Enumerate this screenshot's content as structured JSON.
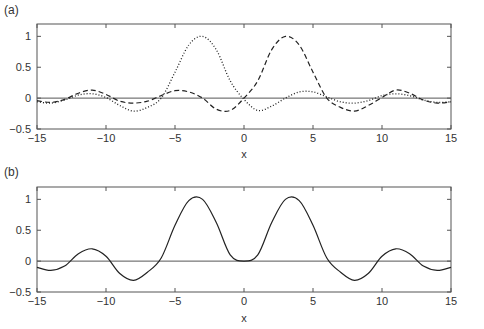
{
  "chart_data": [
    {
      "panel_label": "(a)",
      "type": "line",
      "title": "",
      "xlabel": "x",
      "ylabel": "",
      "xlim": [
        -15,
        15
      ],
      "ylim": [
        -0.5,
        1.2
      ],
      "xticks": [
        -15,
        -10,
        -5,
        0,
        5,
        10,
        15
      ],
      "xtick_labels": [
        "−15",
        "−10",
        "−5",
        "0",
        "5",
        "10",
        "15"
      ],
      "yticks": [
        -0.5,
        0,
        0.5,
        1
      ],
      "ytick_labels": [
        "−0.5",
        "0",
        "0.5",
        "1"
      ],
      "grid": false,
      "legend": null,
      "zero_line": true,
      "x": [
        -15,
        -14,
        -13,
        -12,
        -11,
        -10,
        -9,
        -8,
        -7,
        -6,
        -5,
        -4,
        -3,
        -2,
        -1,
        0,
        1,
        2,
        3,
        4,
        5,
        6,
        7,
        8,
        9,
        10,
        11,
        12,
        13,
        14,
        15
      ],
      "series": [
        {
          "name": "dotted",
          "style": "dotted",
          "values": [
            -0.06,
            -0.08,
            -0.03,
            0.05,
            0.07,
            0.01,
            -0.12,
            -0.21,
            -0.15,
            0.0,
            0.42,
            0.86,
            1.0,
            0.78,
            0.28,
            -0.02,
            -0.2,
            -0.13,
            0.0,
            0.1,
            0.1,
            0.02,
            -0.06,
            -0.08,
            -0.04,
            0.04,
            0.07,
            0.04,
            -0.03,
            -0.07,
            -0.06
          ]
        },
        {
          "name": "dashed",
          "style": "dashed",
          "values": [
            -0.04,
            -0.07,
            -0.02,
            0.08,
            0.13,
            0.06,
            -0.05,
            -0.08,
            -0.05,
            0.04,
            0.12,
            0.1,
            0.0,
            -0.18,
            -0.2,
            0.0,
            0.28,
            0.78,
            1.0,
            0.86,
            0.42,
            0.0,
            -0.15,
            -0.21,
            -0.12,
            0.01,
            0.13,
            0.08,
            -0.03,
            -0.08,
            -0.06
          ]
        }
      ]
    },
    {
      "panel_label": "(b)",
      "type": "line",
      "title": "",
      "xlabel": "x",
      "ylabel": "",
      "xlim": [
        -15,
        15
      ],
      "ylim": [
        -0.5,
        1.2
      ],
      "xticks": [
        -15,
        -10,
        -5,
        0,
        5,
        10,
        15
      ],
      "xtick_labels": [
        "−15",
        "−10",
        "−5",
        "0",
        "5",
        "10",
        "15"
      ],
      "yticks": [
        -0.5,
        0,
        0.5,
        1
      ],
      "ytick_labels": [
        "−0.5",
        "0",
        "0.5",
        "1"
      ],
      "grid": false,
      "legend": null,
      "zero_line": true,
      "x": [
        -15,
        -14,
        -13,
        -12,
        -11,
        -10,
        -9,
        -8,
        -7,
        -6,
        -5,
        -4,
        -3,
        -2,
        -1,
        0,
        1,
        2,
        3,
        4,
        5,
        6,
        7,
        8,
        9,
        10,
        11,
        12,
        13,
        14,
        15
      ],
      "series": [
        {
          "name": "solid",
          "style": "solid",
          "values": [
            -0.1,
            -0.15,
            -0.08,
            0.12,
            0.2,
            0.08,
            -0.2,
            -0.31,
            -0.18,
            0.05,
            0.58,
            0.98,
            1.0,
            0.62,
            0.1,
            0.0,
            0.1,
            0.62,
            1.0,
            0.98,
            0.58,
            0.05,
            -0.18,
            -0.31,
            -0.2,
            0.08,
            0.2,
            0.12,
            -0.08,
            -0.15,
            -0.1
          ]
        }
      ]
    }
  ],
  "labels": {
    "panel_a": "(a)",
    "panel_b": "(b)",
    "xlabel_a": "x",
    "xlabel_b": "x"
  }
}
